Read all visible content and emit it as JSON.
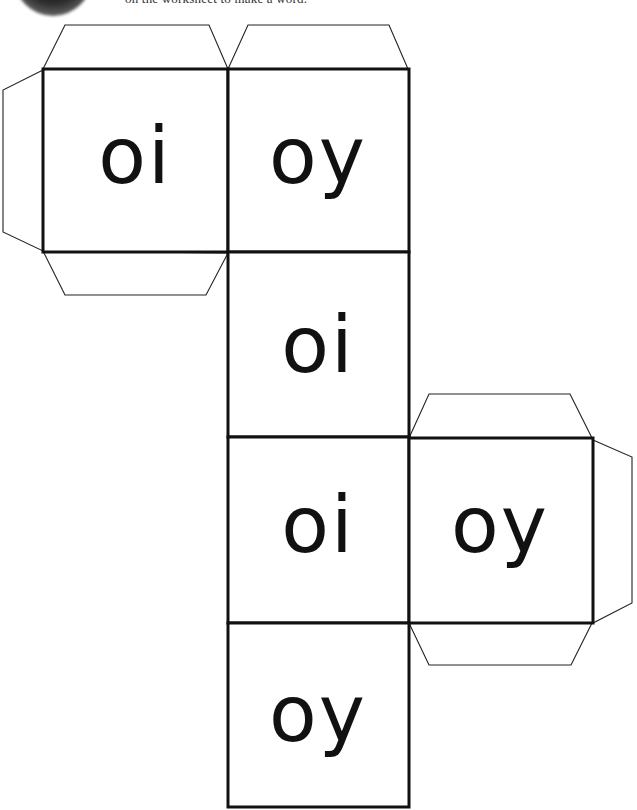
{
  "header": {
    "instructions_fragment": "on the worksheet to make a word."
  },
  "cube_net": {
    "faces": [
      {
        "id": "top-left",
        "label": "oi"
      },
      {
        "id": "top-right",
        "label": "oy"
      },
      {
        "id": "middle-1",
        "label": "oi"
      },
      {
        "id": "middle-2",
        "label": "oi"
      },
      {
        "id": "side-right",
        "label": "oy"
      },
      {
        "id": "bottom",
        "label": "oy"
      }
    ],
    "colors": {
      "line": "#111111",
      "background": "#ffffff"
    }
  }
}
